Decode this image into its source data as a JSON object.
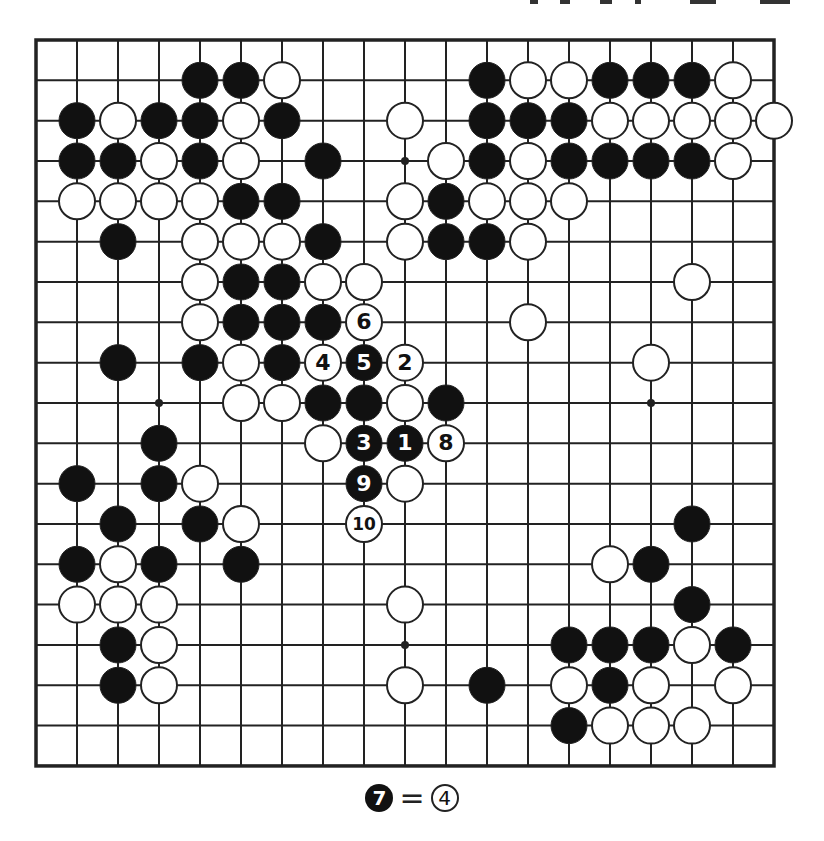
{
  "diagram": {
    "size": 19,
    "origin": {
      "x": 36,
      "y": 40
    },
    "spacing": {
      "x": 41.0,
      "y": 40.33
    },
    "stone_radius": 18,
    "colors": {
      "black": "#111111",
      "white": "#ffffff",
      "line": "#222222",
      "background": "#ffffff"
    },
    "star_points": [
      [
        3,
        9
      ],
      [
        9,
        3
      ],
      [
        9,
        15
      ],
      [
        15,
        9
      ]
    ],
    "stones": [
      {
        "r": 1,
        "c": 4,
        "color": "black"
      },
      {
        "r": 1,
        "c": 5,
        "color": "black"
      },
      {
        "r": 1,
        "c": 6,
        "color": "white"
      },
      {
        "r": 1,
        "c": 11,
        "color": "black"
      },
      {
        "r": 1,
        "c": 12,
        "color": "white"
      },
      {
        "r": 1,
        "c": 13,
        "color": "white"
      },
      {
        "r": 1,
        "c": 14,
        "color": "black"
      },
      {
        "r": 1,
        "c": 15,
        "color": "black"
      },
      {
        "r": 1,
        "c": 16,
        "color": "black"
      },
      {
        "r": 1,
        "c": 17,
        "color": "white"
      },
      {
        "r": 2,
        "c": 1,
        "color": "black"
      },
      {
        "r": 2,
        "c": 2,
        "color": "white"
      },
      {
        "r": 2,
        "c": 3,
        "color": "black"
      },
      {
        "r": 2,
        "c": 4,
        "color": "black"
      },
      {
        "r": 2,
        "c": 5,
        "color": "white"
      },
      {
        "r": 2,
        "c": 6,
        "color": "black"
      },
      {
        "r": 2,
        "c": 9,
        "color": "white"
      },
      {
        "r": 2,
        "c": 11,
        "color": "black"
      },
      {
        "r": 2,
        "c": 12,
        "color": "black"
      },
      {
        "r": 2,
        "c": 13,
        "color": "black"
      },
      {
        "r": 2,
        "c": 14,
        "color": "white"
      },
      {
        "r": 2,
        "c": 15,
        "color": "white"
      },
      {
        "r": 2,
        "c": 16,
        "color": "white"
      },
      {
        "r": 2,
        "c": 17,
        "color": "white"
      },
      {
        "r": 2,
        "c": 18,
        "color": "white"
      },
      {
        "r": 3,
        "c": 1,
        "color": "black"
      },
      {
        "r": 3,
        "c": 2,
        "color": "black"
      },
      {
        "r": 3,
        "c": 3,
        "color": "white"
      },
      {
        "r": 3,
        "c": 4,
        "color": "black"
      },
      {
        "r": 3,
        "c": 5,
        "color": "white"
      },
      {
        "r": 3,
        "c": 7,
        "color": "black"
      },
      {
        "r": 3,
        "c": 10,
        "color": "white"
      },
      {
        "r": 3,
        "c": 11,
        "color": "black"
      },
      {
        "r": 3,
        "c": 12,
        "color": "white"
      },
      {
        "r": 3,
        "c": 13,
        "color": "black"
      },
      {
        "r": 3,
        "c": 14,
        "color": "black"
      },
      {
        "r": 3,
        "c": 15,
        "color": "black"
      },
      {
        "r": 3,
        "c": 16,
        "color": "black"
      },
      {
        "r": 3,
        "c": 17,
        "color": "white"
      },
      {
        "r": 4,
        "c": 1,
        "color": "white"
      },
      {
        "r": 4,
        "c": 2,
        "color": "white"
      },
      {
        "r": 4,
        "c": 3,
        "color": "white"
      },
      {
        "r": 4,
        "c": 4,
        "color": "white"
      },
      {
        "r": 4,
        "c": 5,
        "color": "black"
      },
      {
        "r": 4,
        "c": 6,
        "color": "black"
      },
      {
        "r": 4,
        "c": 9,
        "color": "white"
      },
      {
        "r": 4,
        "c": 10,
        "color": "black"
      },
      {
        "r": 4,
        "c": 11,
        "color": "white"
      },
      {
        "r": 4,
        "c": 12,
        "color": "white"
      },
      {
        "r": 4,
        "c": 13,
        "color": "white"
      },
      {
        "r": 5,
        "c": 2,
        "color": "black"
      },
      {
        "r": 5,
        "c": 4,
        "color": "white"
      },
      {
        "r": 5,
        "c": 5,
        "color": "white"
      },
      {
        "r": 5,
        "c": 6,
        "color": "white"
      },
      {
        "r": 5,
        "c": 7,
        "color": "black"
      },
      {
        "r": 5,
        "c": 9,
        "color": "white"
      },
      {
        "r": 5,
        "c": 10,
        "color": "black"
      },
      {
        "r": 5,
        "c": 11,
        "color": "black"
      },
      {
        "r": 5,
        "c": 12,
        "color": "white"
      },
      {
        "r": 6,
        "c": 4,
        "color": "white"
      },
      {
        "r": 6,
        "c": 5,
        "color": "black"
      },
      {
        "r": 6,
        "c": 6,
        "color": "black"
      },
      {
        "r": 6,
        "c": 7,
        "color": "white"
      },
      {
        "r": 6,
        "c": 8,
        "color": "white"
      },
      {
        "r": 6,
        "c": 16,
        "color": "white"
      },
      {
        "r": 7,
        "c": 4,
        "color": "white"
      },
      {
        "r": 7,
        "c": 5,
        "color": "black"
      },
      {
        "r": 7,
        "c": 6,
        "color": "black"
      },
      {
        "r": 7,
        "c": 7,
        "color": "black"
      },
      {
        "r": 7,
        "c": 8,
        "color": "white",
        "label": "6"
      },
      {
        "r": 7,
        "c": 12,
        "color": "white"
      },
      {
        "r": 8,
        "c": 2,
        "color": "black"
      },
      {
        "r": 8,
        "c": 4,
        "color": "black"
      },
      {
        "r": 8,
        "c": 5,
        "color": "white"
      },
      {
        "r": 8,
        "c": 6,
        "color": "black"
      },
      {
        "r": 8,
        "c": 7,
        "color": "white",
        "label": "4"
      },
      {
        "r": 8,
        "c": 8,
        "color": "black",
        "label": "5"
      },
      {
        "r": 8,
        "c": 9,
        "color": "white",
        "label": "2"
      },
      {
        "r": 8,
        "c": 15,
        "color": "white"
      },
      {
        "r": 9,
        "c": 5,
        "color": "white"
      },
      {
        "r": 9,
        "c": 6,
        "color": "white"
      },
      {
        "r": 9,
        "c": 7,
        "color": "black"
      },
      {
        "r": 9,
        "c": 8,
        "color": "black"
      },
      {
        "r": 9,
        "c": 9,
        "color": "white"
      },
      {
        "r": 9,
        "c": 10,
        "color": "black"
      },
      {
        "r": 10,
        "c": 3,
        "color": "black"
      },
      {
        "r": 10,
        "c": 7,
        "color": "white"
      },
      {
        "r": 10,
        "c": 8,
        "color": "black",
        "label": "3"
      },
      {
        "r": 10,
        "c": 9,
        "color": "black",
        "label": "1"
      },
      {
        "r": 10,
        "c": 10,
        "color": "white",
        "label": "8"
      },
      {
        "r": 11,
        "c": 1,
        "color": "black"
      },
      {
        "r": 11,
        "c": 3,
        "color": "black"
      },
      {
        "r": 11,
        "c": 4,
        "color": "white"
      },
      {
        "r": 11,
        "c": 8,
        "color": "black",
        "label": "9"
      },
      {
        "r": 11,
        "c": 9,
        "color": "white"
      },
      {
        "r": 12,
        "c": 2,
        "color": "black"
      },
      {
        "r": 12,
        "c": 4,
        "color": "black"
      },
      {
        "r": 12,
        "c": 5,
        "color": "white"
      },
      {
        "r": 12,
        "c": 8,
        "color": "white",
        "label": "10"
      },
      {
        "r": 12,
        "c": 16,
        "color": "black"
      },
      {
        "r": 13,
        "c": 1,
        "color": "black"
      },
      {
        "r": 13,
        "c": 2,
        "color": "white"
      },
      {
        "r": 13,
        "c": 3,
        "color": "black"
      },
      {
        "r": 13,
        "c": 5,
        "color": "black"
      },
      {
        "r": 13,
        "c": 14,
        "color": "white"
      },
      {
        "r": 13,
        "c": 15,
        "color": "black"
      },
      {
        "r": 14,
        "c": 1,
        "color": "white"
      },
      {
        "r": 14,
        "c": 2,
        "color": "white"
      },
      {
        "r": 14,
        "c": 3,
        "color": "white"
      },
      {
        "r": 14,
        "c": 9,
        "color": "white"
      },
      {
        "r": 14,
        "c": 16,
        "color": "black"
      },
      {
        "r": 15,
        "c": 2,
        "color": "black"
      },
      {
        "r": 15,
        "c": 3,
        "color": "white"
      },
      {
        "r": 15,
        "c": 13,
        "color": "black"
      },
      {
        "r": 15,
        "c": 14,
        "color": "black"
      },
      {
        "r": 15,
        "c": 15,
        "color": "black"
      },
      {
        "r": 15,
        "c": 16,
        "color": "white"
      },
      {
        "r": 15,
        "c": 17,
        "color": "black"
      },
      {
        "r": 16,
        "c": 2,
        "color": "black"
      },
      {
        "r": 16,
        "c": 3,
        "color": "white"
      },
      {
        "r": 16,
        "c": 9,
        "color": "white"
      },
      {
        "r": 16,
        "c": 11,
        "color": "black"
      },
      {
        "r": 16,
        "c": 13,
        "color": "white"
      },
      {
        "r": 16,
        "c": 14,
        "color": "black"
      },
      {
        "r": 16,
        "c": 15,
        "color": "white"
      },
      {
        "r": 16,
        "c": 17,
        "color": "white"
      },
      {
        "r": 17,
        "c": 13,
        "color": "black"
      },
      {
        "r": 17,
        "c": 14,
        "color": "white"
      },
      {
        "r": 17,
        "c": 15,
        "color": "white"
      },
      {
        "r": 17,
        "c": 16,
        "color": "white"
      }
    ]
  },
  "caption": {
    "left_stone": {
      "color": "black",
      "label": "7"
    },
    "equals": "=",
    "right_stone": {
      "color": "white",
      "label": "4"
    }
  }
}
